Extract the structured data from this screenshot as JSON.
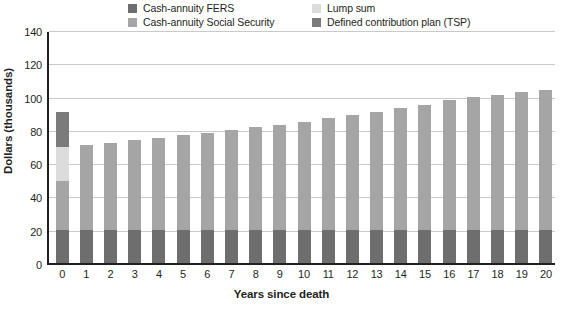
{
  "chart_data": {
    "type": "bar",
    "stacked": true,
    "title": "",
    "xlabel": "Years since death",
    "ylabel": "Dollars (thousands)",
    "ylim": [
      0,
      140
    ],
    "ytick_step": 20,
    "yticks": [
      "140",
      "120",
      "100",
      "80",
      "60",
      "40",
      "20",
      "0"
    ],
    "grid": true,
    "legend_position": "top",
    "categories": [
      "0",
      "1",
      "2",
      "3",
      "4",
      "5",
      "6",
      "7",
      "8",
      "9",
      "10",
      "11",
      "12",
      "13",
      "14",
      "15",
      "16",
      "17",
      "18",
      "19",
      "20"
    ],
    "series": [
      {
        "name": "Cash-annuity FERS",
        "color": "#6e6e6e",
        "values": [
          20,
          20,
          20,
          20,
          20,
          20,
          20,
          20,
          20,
          20,
          20,
          20,
          20,
          20,
          20,
          20,
          20,
          20,
          20,
          20,
          20
        ]
      },
      {
        "name": "Cash-annuity Social Security",
        "color": "#a5a5a5",
        "values": [
          29,
          51,
          52,
          54,
          55,
          57,
          58,
          60,
          62,
          63,
          65,
          67,
          69,
          71,
          73,
          75,
          78,
          80,
          81,
          83,
          84
        ]
      },
      {
        "name": "Lump sum",
        "color": "#dcdcdc",
        "values": [
          21,
          0,
          0,
          0,
          0,
          0,
          0,
          0,
          0,
          0,
          0,
          0,
          0,
          0,
          0,
          0,
          0,
          0,
          0,
          0,
          0
        ]
      },
      {
        "name": "Defined contribution plan (TSP)",
        "color": "#7b7b7b",
        "values": [
          21,
          0,
          0,
          0,
          0,
          0,
          0,
          0,
          0,
          0,
          0,
          0,
          0,
          0,
          0,
          0,
          0,
          0,
          0,
          0,
          0
        ]
      }
    ],
    "totals": [
      91,
      71,
      72,
      74,
      75,
      77,
      78,
      80,
      82,
      83,
      85,
      87,
      89,
      91,
      93,
      95,
      98,
      100,
      101,
      103,
      104
    ]
  },
  "legend": {
    "items": [
      {
        "label": "Cash-annuity FERS",
        "color": "#6e6e6e"
      },
      {
        "label": "Cash-annuity Social Security",
        "color": "#a5a5a5"
      },
      {
        "label": "Lump sum",
        "color": "#dcdcdc"
      },
      {
        "label": "Defined contribution plan (TSP)",
        "color": "#7b7b7b"
      }
    ]
  },
  "colors": {
    "axis": "#231f20",
    "grid": "#c9c9c9",
    "background": "#ffffff"
  }
}
